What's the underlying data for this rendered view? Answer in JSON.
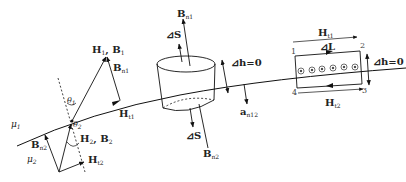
{
  "figure": {
    "media": {
      "upper": {
        "symbol": "μ",
        "sub": "1"
      },
      "lower": {
        "symbol": "μ",
        "sub": "2"
      }
    },
    "left_vectors": {
      "h1_b1": {
        "main": "H",
        "sub1": "1",
        "sep": ", B",
        "sub2": "1"
      },
      "bn1": {
        "main": "B",
        "sub": "n1"
      },
      "ht1": {
        "main": "H",
        "sub": "t1"
      },
      "theta1": {
        "main": "θ",
        "sub": "1"
      },
      "theta2": {
        "main": "θ",
        "sub": "2"
      },
      "h2_b2": {
        "main": "H",
        "sub1": "2",
        "sep": ", B",
        "sub2": "2"
      },
      "bn2": {
        "main": "B",
        "sub": "n2"
      },
      "ht2": {
        "main": "H",
        "sub": "t2"
      }
    },
    "pillbox": {
      "bn1": {
        "main": "B",
        "sub": "n1"
      },
      "ds_top": "⊿S",
      "ds_bottom": "⊿S",
      "bn2": {
        "main": "B",
        "sub": "n2"
      },
      "dh": "⊿h=0",
      "an12": {
        "main": "a",
        "sub": "n12"
      }
    },
    "loop": {
      "ht1": {
        "main": "H",
        "sub": "t1"
      },
      "dl": "⊿L",
      "dh": "⊿h=0",
      "ht2": {
        "main": "H",
        "sub": "t2"
      },
      "corners": [
        "1",
        "2",
        "3",
        "4"
      ],
      "current_markers": 6
    }
  }
}
